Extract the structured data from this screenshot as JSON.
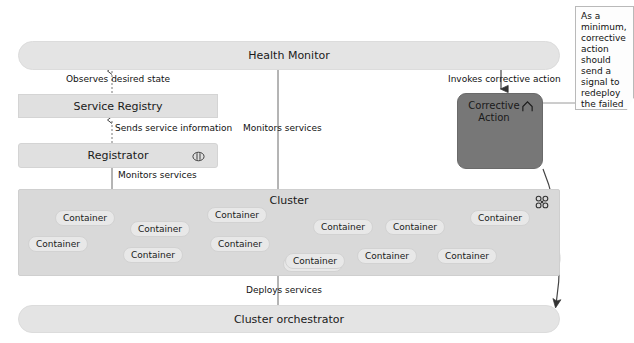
{
  "diagram": {
    "nodes": {
      "health_monitor": {
        "label": "Health Monitor"
      },
      "service_registry": {
        "label": "Service Registry"
      },
      "registrator": {
        "label": "Registrator",
        "icon": "component-icon"
      },
      "cluster": {
        "label": "Cluster",
        "icon": "cluster-nodes-icon"
      },
      "cluster_orchestrator": {
        "label": "Cluster orchestrator"
      },
      "corrective_action": {
        "label_line1": "Corrective",
        "label_line2": "Action",
        "icon": "chevron-up-home-icon"
      }
    },
    "containers": [
      {
        "label": "Container",
        "x": 55,
        "y": 210
      },
      {
        "label": "Container",
        "x": 130,
        "y": 221
      },
      {
        "label": "Container",
        "x": 207,
        "y": 207
      },
      {
        "label": "Container",
        "x": 313,
        "y": 219
      },
      {
        "label": "Container",
        "x": 385,
        "y": 219
      },
      {
        "label": "Container",
        "x": 470,
        "y": 210
      },
      {
        "label": "Container",
        "x": 28,
        "y": 236
      },
      {
        "label": "Container",
        "x": 123,
        "y": 247
      },
      {
        "label": "Container",
        "x": 210,
        "y": 236
      },
      {
        "label": "Container",
        "x": 283,
        "y": 256
      },
      {
        "label": "Container",
        "x": 357,
        "y": 248
      },
      {
        "label": "Container",
        "x": 437,
        "y": 248
      },
      {
        "label": "Container",
        "x": 285,
        "y": 253
      }
    ],
    "edges": [
      {
        "id": "observes",
        "label": "Observes desired state"
      },
      {
        "id": "sends",
        "label": "Sends service information"
      },
      {
        "id": "monitors_1",
        "label": "Monitors services"
      },
      {
        "id": "monitors_2",
        "label": "Monitors services"
      },
      {
        "id": "invokes",
        "label": "Invokes corrective action"
      },
      {
        "id": "deploys",
        "label": "Deploys services"
      }
    ],
    "note": {
      "text": "As a minimum, corrective action should send a signal to redeploy the failed service."
    },
    "colors": {
      "bar_fill": "#e2e2e2",
      "cluster_fill": "#d9d9d9",
      "chip_fill": "#e8e8e8",
      "corrective_action_fill": "#777777",
      "line": "#555555",
      "note_fill": "#fdfdfd"
    }
  }
}
